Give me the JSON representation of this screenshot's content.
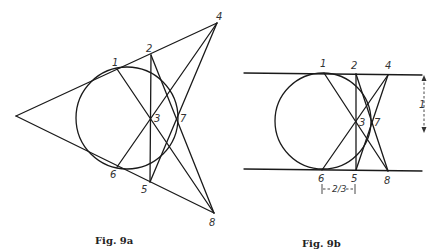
{
  "figures": [
    {
      "id": "9a",
      "caption": "Fig. 9a",
      "points": {
        "1": {
          "label": "1"
        },
        "2": {
          "label": "2"
        },
        "3": {
          "label": "3"
        },
        "4": {
          "label": "4"
        },
        "5": {
          "label": "5"
        },
        "6": {
          "label": "6"
        },
        "7": {
          "label": "7"
        },
        "8": {
          "label": "8"
        }
      }
    },
    {
      "id": "9b",
      "caption": "Fig. 9b",
      "points": {
        "1": {
          "label": "1"
        },
        "2": {
          "label": "2"
        },
        "3": {
          "label": "3"
        },
        "4": {
          "label": "4"
        },
        "5": {
          "label": "5"
        },
        "6": {
          "label": "6"
        },
        "7": {
          "label": "7"
        },
        "8": {
          "label": "8"
        }
      },
      "dimensions": {
        "height": "1",
        "offset": "2/3"
      }
    }
  ]
}
